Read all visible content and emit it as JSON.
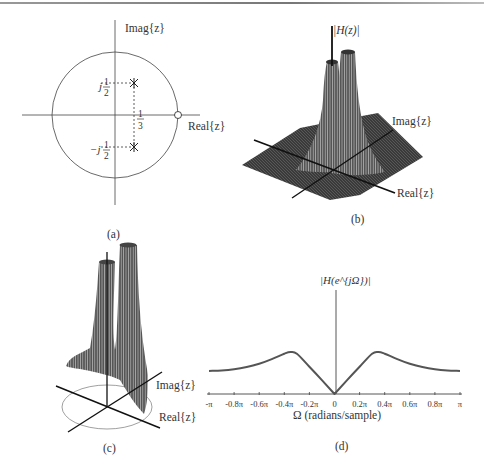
{
  "figure": {
    "panels": [
      {
        "id": "a",
        "caption": "(a)",
        "type": "pole-zero plot",
        "axis_labels": {
          "x": "Real{z}",
          "y": "Imag{z}"
        },
        "unit_circle": true,
        "poles": [
          {
            "re": 0.333,
            "im": 0.5
          },
          {
            "re": 0.333,
            "im": -0.5
          }
        ],
        "zeros": [
          {
            "re": 1,
            "im": 0
          }
        ],
        "annotations": {
          "pole_upper": "j",
          "pole_lower": "−j",
          "half_num": "1",
          "half_den": "2",
          "third_num": "1",
          "third_den": "3"
        }
      },
      {
        "id": "b",
        "caption": "(b)",
        "type": "3D surface |H(z)|",
        "axis_labels": {
          "z": "|H(z)|",
          "x": "Real{z}",
          "y": "Imag{z}"
        }
      },
      {
        "id": "c",
        "caption": "(c)",
        "type": "3D surface over unit circle",
        "axis_labels": {
          "x": "Real{z}",
          "y": "Imag{z}"
        }
      },
      {
        "id": "d",
        "caption": "(d)",
        "type": "magnitude response",
        "ylabel": "|H(e^{jΩ})|",
        "xlabel": "Ω (radians/sample)"
      }
    ]
  },
  "chart_data": [
    {
      "type": "line",
      "title": "(d)",
      "xlabel": "Ω (radians/sample)",
      "ylabel": "|H(e^{jΩ})|",
      "xticks": [
        "-π",
        "-0.8π",
        "-0.6π",
        "-0.4π",
        "-0.2π",
        "0",
        "0.2π",
        "0.4π",
        "0.6π",
        "0.8π",
        "π"
      ],
      "x": [
        -1.0,
        -0.9,
        -0.8,
        -0.7,
        -0.6,
        -0.5,
        -0.4,
        -0.35,
        -0.3,
        -0.2,
        -0.1,
        0,
        0.1,
        0.2,
        0.3,
        0.35,
        0.4,
        0.5,
        0.6,
        0.7,
        0.8,
        0.9,
        1.0
      ],
      "x_units": "multiples of pi",
      "values": [
        0.55,
        0.56,
        0.59,
        0.64,
        0.72,
        0.83,
        0.96,
        1.0,
        0.96,
        0.65,
        0.33,
        0.0,
        0.33,
        0.65,
        0.96,
        1.0,
        0.96,
        0.83,
        0.72,
        0.64,
        0.59,
        0.56,
        0.55
      ],
      "ylim": [
        0,
        1.2
      ],
      "grid": false,
      "legend": null
    }
  ],
  "text": {
    "imag_a": "Imag{z}",
    "real_a": "Real{z}",
    "hz_b": "|H(z)|",
    "imag_b": "Imag{z}",
    "real_b": "Real{z}",
    "imag_c": "Imag{z}",
    "real_c": "Real{z}",
    "ylabel_d": "|H(e^{jΩ})|",
    "xlabel_d": "Ω (radians/sample)",
    "cap_a": "(a)",
    "cap_b": "(b)",
    "cap_c": "(c)",
    "cap_d": "(d)"
  }
}
